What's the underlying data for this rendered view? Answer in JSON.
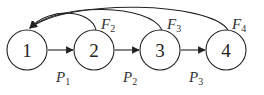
{
  "diagram": {
    "nodes": [
      {
        "id": "1",
        "label": "1",
        "cx": 27,
        "cy": 50
      },
      {
        "id": "2",
        "label": "2",
        "cx": 94,
        "cy": 50
      },
      {
        "id": "3",
        "label": "3",
        "cx": 160,
        "cy": 50
      },
      {
        "id": "4",
        "label": "4",
        "cx": 226,
        "cy": 50
      }
    ],
    "forward_edges": [
      {
        "from": "1",
        "to": "2",
        "label": "P",
        "sub": "1"
      },
      {
        "from": "2",
        "to": "3",
        "label": "P",
        "sub": "2"
      },
      {
        "from": "3",
        "to": "4",
        "label": "P",
        "sub": "3"
      }
    ],
    "feedback_edges": [
      {
        "from": "2",
        "to": "1",
        "label": "F",
        "sub": "2"
      },
      {
        "from": "3",
        "to": "1",
        "label": "F",
        "sub": "3"
      },
      {
        "from": "4",
        "to": "1",
        "label": "F",
        "sub": "4"
      }
    ],
    "colors": {
      "stroke": "#222222",
      "background": "#ffffff"
    }
  }
}
